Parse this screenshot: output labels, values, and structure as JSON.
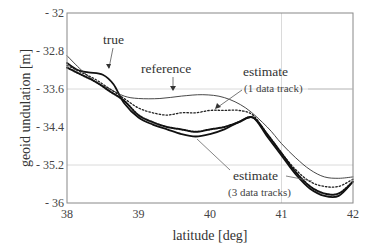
{
  "chart_data": {
    "type": "line",
    "title": "",
    "xlabel": "latitude [deg]",
    "ylabel": "geoid undulation [m]",
    "xlim": [
      38,
      42
    ],
    "ylim": [
      -36,
      -32
    ],
    "xticks": [
      38,
      39,
      40,
      41,
      42
    ],
    "yticks": [
      -32,
      -32.8,
      -33.6,
      -34.4,
      -35.2,
      -36
    ],
    "xtick_labels": [
      "38",
      "39",
      "40",
      "41",
      "42"
    ],
    "ytick_labels": [
      "- 32",
      "- 32.8",
      "- 33.6",
      "- 34.4",
      "- 35.2",
      "- 36"
    ],
    "grid": {
      "x": [
        41
      ],
      "y": [
        -33.6,
        -35.2
      ]
    },
    "legend": "none (inline annotations)",
    "series": [
      {
        "name": "true",
        "style": "thick-solid",
        "x": [
          38.0,
          38.15,
          38.3,
          38.5,
          38.65,
          38.8,
          39.0,
          39.2,
          39.4,
          39.6,
          39.8,
          40.0,
          40.2,
          40.4,
          40.6,
          40.8,
          41.0,
          41.2,
          41.4,
          41.6,
          41.8,
          42.0
        ],
        "y": [
          -33.05,
          -33.2,
          -33.25,
          -33.3,
          -33.5,
          -33.9,
          -34.2,
          -34.35,
          -34.45,
          -34.55,
          -34.6,
          -34.55,
          -34.45,
          -34.3,
          -34.2,
          -34.6,
          -35.0,
          -35.4,
          -35.7,
          -35.85,
          -35.85,
          -35.55
        ]
      },
      {
        "name": "reference",
        "style": "thin-solid",
        "x": [
          38.0,
          38.2,
          38.4,
          38.6,
          38.8,
          39.0,
          39.3,
          39.6,
          39.9,
          40.2,
          40.5,
          40.8,
          41.0,
          41.2,
          41.4,
          41.6,
          41.8,
          42.0
        ],
        "y": [
          -32.9,
          -33.2,
          -33.45,
          -33.6,
          -33.75,
          -33.8,
          -33.8,
          -33.75,
          -33.72,
          -33.78,
          -34.0,
          -34.4,
          -34.75,
          -35.05,
          -35.3,
          -35.45,
          -35.48,
          -35.45
        ]
      },
      {
        "name": "estimate (1 data track)",
        "style": "dotted",
        "x": [
          38.0,
          38.2,
          38.4,
          38.6,
          38.8,
          39.0,
          39.2,
          39.4,
          39.6,
          39.8,
          40.0,
          40.2,
          40.4,
          40.6,
          40.8,
          41.0,
          41.2,
          41.4,
          41.6,
          41.8,
          42.0
        ],
        "y": [
          -33.1,
          -33.25,
          -33.4,
          -33.6,
          -33.8,
          -34.0,
          -34.1,
          -34.15,
          -34.1,
          -34.1,
          -34.05,
          -34.05,
          -34.05,
          -34.15,
          -34.55,
          -34.95,
          -35.3,
          -35.55,
          -35.65,
          -35.65,
          -35.5
        ]
      },
      {
        "name": "estimate (3 data tracks)",
        "style": "dense-dotted",
        "x": [
          38.0,
          38.2,
          38.4,
          38.6,
          38.8,
          39.0,
          39.2,
          39.4,
          39.6,
          39.8,
          40.0,
          40.2,
          40.4,
          40.6,
          40.8,
          41.0,
          41.2,
          41.4,
          41.6,
          41.8,
          42.0
        ],
        "y": [
          -33.15,
          -33.3,
          -33.45,
          -33.65,
          -33.85,
          -34.15,
          -34.3,
          -34.4,
          -34.45,
          -34.5,
          -34.45,
          -34.4,
          -34.3,
          -34.2,
          -34.55,
          -34.95,
          -35.35,
          -35.65,
          -35.8,
          -35.8,
          -35.55
        ]
      }
    ],
    "annotations": [
      {
        "text": "true",
        "x": 38.6,
        "y": -32.5
      },
      {
        "text": "reference",
        "x": 39.45,
        "y": -33.25
      },
      {
        "text": "estimate",
        "sub": "(1 data track)",
        "x": 40.95,
        "y": -33.3
      },
      {
        "text": "estimate",
        "sub": "(3 data tracks)",
        "x": 41.1,
        "y": -35.35
      }
    ]
  },
  "labels": {
    "xlabel": "latitude [deg]",
    "ylabel": "geoid undulation [m]",
    "ann_true": "true",
    "ann_reference": "reference",
    "ann_est1": "estimate",
    "ann_est1_sub": "(1 data track)",
    "ann_est3": "estimate",
    "ann_est3_sub": "(3 data tracks)"
  }
}
